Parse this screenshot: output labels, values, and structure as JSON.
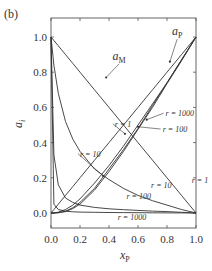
{
  "panel_label": "(b)",
  "chart_data": {
    "type": "line",
    "title": "",
    "panel": "(b)",
    "xlabel": "x_P",
    "ylabel": "a_i",
    "xlim": [
      0.0,
      1.0
    ],
    "ylim": [
      -0.08,
      1.08
    ],
    "x_ticks": [
      "0.0",
      "0.2",
      "0.4",
      "0.6",
      "0.8",
      "1.0"
    ],
    "y_ticks": [
      "0.0",
      "0.2",
      "0.4",
      "0.6",
      "0.8",
      "1.0"
    ],
    "grid": false,
    "legend": "inline annotations",
    "x": [
      0.0,
      0.02,
      0.05,
      0.1,
      0.15,
      0.2,
      0.3,
      0.4,
      0.5,
      0.6,
      0.7,
      0.8,
      0.9,
      1.0
    ],
    "series": [
      {
        "name": "a_M, r = 1",
        "group": "a_M",
        "values": [
          1.0,
          0.98,
          0.95,
          0.9,
          0.85,
          0.8,
          0.7,
          0.6,
          0.5,
          0.4,
          0.3,
          0.2,
          0.1,
          0.0
        ]
      },
      {
        "name": "a_M, r = 10",
        "group": "a_M",
        "values": [
          1.0,
          0.84,
          0.68,
          0.52,
          0.42,
          0.35,
          0.25,
          0.19,
          0.14,
          0.1,
          0.07,
          0.045,
          0.02,
          0.0
        ]
      },
      {
        "name": "a_M, r = 100",
        "group": "a_M",
        "values": [
          1.0,
          0.33,
          0.16,
          0.085,
          0.06,
          0.045,
          0.032,
          0.024,
          0.019,
          0.015,
          0.011,
          0.008,
          0.004,
          0.0
        ]
      },
      {
        "name": "a_M, r = 1000",
        "group": "a_M",
        "values": [
          1.0,
          0.05,
          0.02,
          0.01,
          0.007,
          0.005,
          0.004,
          0.003,
          0.002,
          0.0015,
          0.001,
          0.0008,
          0.0004,
          0.0
        ]
      },
      {
        "name": "a_P, r = 1",
        "group": "a_P",
        "values": [
          0.0,
          0.02,
          0.05,
          0.1,
          0.15,
          0.2,
          0.3,
          0.4,
          0.5,
          0.6,
          0.7,
          0.8,
          0.9,
          1.0
        ]
      },
      {
        "name": "a_P, r = 10",
        "group": "a_P",
        "values": [
          0.0,
          0.0,
          0.005,
          0.02,
          0.045,
          0.08,
          0.17,
          0.27,
          0.38,
          0.5,
          0.62,
          0.74,
          0.87,
          1.0
        ]
      },
      {
        "name": "a_P, r = 100",
        "group": "a_P",
        "values": [
          0.0,
          0.0,
          0.002,
          0.01,
          0.03,
          0.06,
          0.14,
          0.25,
          0.36,
          0.48,
          0.61,
          0.74,
          0.87,
          1.0
        ]
      },
      {
        "name": "a_P, r = 1000",
        "group": "a_P",
        "values": [
          0.0,
          0.0,
          0.001,
          0.008,
          0.025,
          0.05,
          0.13,
          0.235,
          0.35,
          0.475,
          0.6,
          0.735,
          0.865,
          1.0
        ]
      }
    ],
    "annotations": [
      {
        "text": "a_M",
        "x": 0.47,
        "y": 0.87,
        "arrow_to": [
          0.38,
          0.77
        ]
      },
      {
        "text": "a_P",
        "x": 0.87,
        "y": 1.01,
        "arrow_to": [
          0.82,
          0.86
        ]
      },
      {
        "text": "r = 1000",
        "x": 0.79,
        "y": 0.55,
        "arrow_to": [
          0.66,
          0.53
        ]
      },
      {
        "text": "r = 100",
        "x": 0.77,
        "y": 0.46,
        "arrow_to": [
          0.6,
          0.49
        ]
      },
      {
        "text": "r = 1",
        "x": 0.44,
        "y": 0.49,
        "arrow_to": [
          0.51,
          0.45
        ]
      },
      {
        "text": "r = 10",
        "x": 0.2,
        "y": 0.32,
        "arrow_to": [
          0.36,
          0.21
        ]
      },
      {
        "text": "r = 1",
        "x": 0.97,
        "y": 0.17
      },
      {
        "text": "r = 10",
        "x": 0.69,
        "y": 0.14
      },
      {
        "text": "r = 100",
        "x": 0.52,
        "y": 0.08
      },
      {
        "text": "r = 1000",
        "x": 0.46,
        "y": -0.04
      }
    ]
  }
}
